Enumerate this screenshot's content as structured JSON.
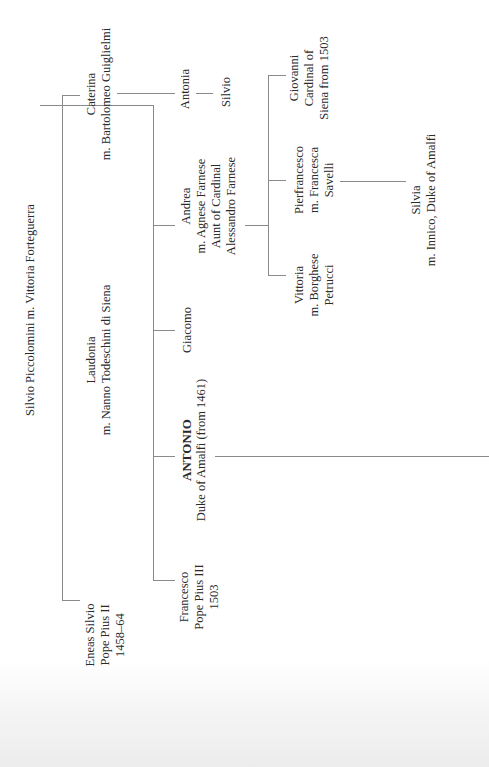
{
  "diagram": {
    "type": "family-tree",
    "orientation": "rotated-90-ccw",
    "line_color": "#8a8a8a",
    "root": {
      "label": "Silvio Piccolomini m. Vittoria Forteguerra"
    },
    "generation1": [
      {
        "id": "caterina",
        "lines": [
          "Caterina",
          "m. Bartolomeo Guiglielmi"
        ]
      },
      {
        "id": "laudonia",
        "lines": [
          "Laudonia",
          "m. Nanno Todeschini di Siena"
        ]
      },
      {
        "id": "eneas",
        "lines": [
          "Eneas Silvio",
          "Pope Pius II",
          "1458–64"
        ]
      }
    ],
    "caterina_descendants": [
      {
        "id": "antonia",
        "lines": [
          "Antonia"
        ]
      },
      {
        "id": "silvio",
        "lines": [
          "Silvio"
        ]
      }
    ],
    "laudonia_children": [
      {
        "id": "andrea",
        "lines": [
          "Andrea",
          "m. Agnese Farnese",
          "Aunt of Cardinal",
          "Alessandro Farnese"
        ]
      },
      {
        "id": "giacomo",
        "lines": [
          "Giacomo"
        ]
      },
      {
        "id": "antonio",
        "lines": [
          "ANTONIO",
          "Duke of Amalfi (from 1461)"
        ],
        "emphasis": "bold-first-line"
      },
      {
        "id": "francesco",
        "lines": [
          "Francesco",
          "Pope Pius III",
          "1503"
        ]
      }
    ],
    "andrea_children": [
      {
        "id": "giovanni",
        "lines": [
          "Giovanni",
          "Cardinal of",
          "Siena from 1503"
        ]
      },
      {
        "id": "pierfrancesco",
        "lines": [
          "Pierfrancesco",
          "m. Francesca",
          "Savelli"
        ]
      },
      {
        "id": "vittoria",
        "lines": [
          "Vittoria",
          "m. Borghese",
          "Petrucci"
        ]
      }
    ],
    "pierfrancesco_children": [
      {
        "id": "silvia",
        "lines": [
          "Silvia",
          "m. Innico, Duke of Amalfi"
        ]
      }
    ]
  }
}
